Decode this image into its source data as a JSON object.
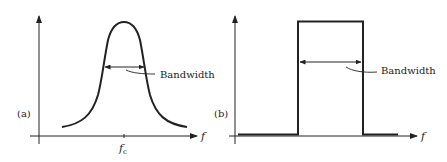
{
  "figure": {
    "panels": [
      {
        "id": "a",
        "label": "(a)",
        "shape": "bell curve",
        "annotation": "Bandwidth",
        "x_axis_label": "f",
        "center_tick_label": "f",
        "center_tick_subscript": "c"
      },
      {
        "id": "b",
        "label": "(b)",
        "shape": "rectangular pulse",
        "annotation": "Bandwidth",
        "x_axis_label": "f"
      }
    ],
    "colors": {
      "line": "#222222",
      "background": "#ffffff"
    }
  }
}
